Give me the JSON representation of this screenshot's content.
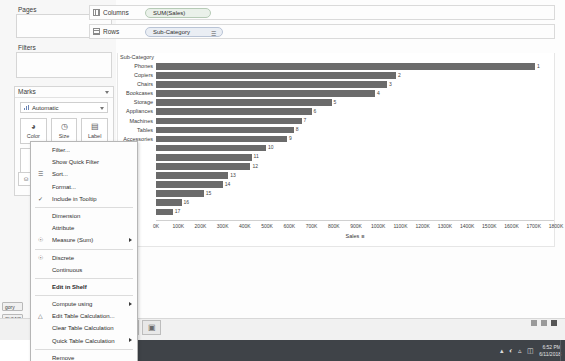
{
  "app": {
    "left_panel": {
      "pages_label": "Pages",
      "filters_label": "Filters",
      "marks_label": "Marks",
      "mark_type": "Automatic",
      "mark_buttons": [
        {
          "label": "Color",
          "icon": "palette-icon",
          "glyph": "◕"
        },
        {
          "label": "Size",
          "icon": "size-icon",
          "glyph": "◷"
        },
        {
          "label": "Label",
          "icon": "label-icon",
          "glyph": "▤"
        }
      ],
      "mark_buttons_row2": [
        {
          "label": "Detail",
          "icon": "detail-icon",
          "glyph": "⁙"
        },
        {
          "label": "Tooltip",
          "icon": "tooltip-icon",
          "glyph": "□"
        }
      ],
      "mini_pill_glyph": "⛁",
      "bottom_pills": [
        {
          "name": "sub-category-pill",
          "text": "gory"
        },
        {
          "name": "sum-sales-pill",
          "text": "SUM(S"
        }
      ],
      "bottom_icon_glyph": "◔"
    },
    "shelves": [
      {
        "icon": "columns-icon",
        "label": "Columns",
        "pill": {
          "text": "SUM(Sales)",
          "color": "green",
          "sort_icon": ""
        }
      },
      {
        "icon": "rows-icon",
        "label": "Rows",
        "pill": {
          "text": "Sub-Category",
          "color": "blue",
          "sort_icon": "☰"
        }
      }
    ],
    "context_menu": {
      "items": [
        {
          "label": "Filter...",
          "lead": "",
          "submenu": false,
          "bold": false,
          "sep_after": false
        },
        {
          "label": "Show Quick Filter",
          "lead": "",
          "submenu": false,
          "bold": false,
          "sep_after": false
        },
        {
          "label": "Sort...",
          "lead": "sort-icon",
          "submenu": false,
          "bold": false,
          "sep_after": false
        },
        {
          "label": "Format...",
          "lead": "",
          "submenu": false,
          "bold": false,
          "sep_after": false
        },
        {
          "label": "Include in Tooltip",
          "lead": "check-icon",
          "submenu": false,
          "bold": false,
          "sep_after": true
        },
        {
          "label": "Dimension",
          "lead": "",
          "submenu": false,
          "bold": false,
          "sep_after": false
        },
        {
          "label": "Attribute",
          "lead": "",
          "submenu": false,
          "bold": false,
          "sep_after": false
        },
        {
          "label": "Measure (Sum)",
          "lead": "radio-icon",
          "submenu": true,
          "bold": false,
          "sep_after": true
        },
        {
          "label": "Discrete",
          "lead": "radio-icon",
          "submenu": false,
          "bold": false,
          "sep_after": false
        },
        {
          "label": "Continuous",
          "lead": "",
          "submenu": false,
          "bold": false,
          "sep_after": true
        },
        {
          "label": "Edit in Shelf",
          "lead": "",
          "submenu": false,
          "bold": true,
          "sep_after": true
        },
        {
          "label": "Compute using",
          "lead": "",
          "submenu": true,
          "bold": false,
          "sep_after": false
        },
        {
          "label": "Edit Table Calculation...",
          "lead": "delta-icon",
          "submenu": false,
          "bold": false,
          "sep_after": false
        },
        {
          "label": "Clear Table Calculation",
          "lead": "",
          "submenu": false,
          "bold": false,
          "sep_after": false
        },
        {
          "label": "Quick Table Calculation",
          "lead": "",
          "submenu": true,
          "bold": false,
          "sep_after": true
        },
        {
          "label": "Remove",
          "lead": "",
          "submenu": false,
          "bold": false,
          "sep_after": false
        }
      ]
    },
    "bottom": {
      "sheet_tabs": [
        {
          "name": "new-worksheet-tab",
          "glyph": "⊞"
        },
        {
          "name": "new-dashboard-tab",
          "glyph": "▣"
        }
      ],
      "status_text": ""
    },
    "taskbar": {
      "time": "6:52 PM",
      "date": "6/11/2018",
      "tray_icons": [
        "chevron-up-icon",
        "network-icon",
        "sound-icon",
        "battery-icon"
      ]
    }
  },
  "chart_data": {
    "type": "bar",
    "title": "",
    "xlabel": "Sales",
    "ylabel": "Sub-Category",
    "grid": false,
    "legend": false,
    "xlim": [
      0,
      1800000
    ],
    "xticks": [
      "0K",
      "100K",
      "200K",
      "300K",
      "400K",
      "500K",
      "600K",
      "700K",
      "800K",
      "900K",
      "1000K",
      "1100K",
      "1200K",
      "1300K",
      "1400K",
      "1500K",
      "1600K",
      "1700K",
      "1800K"
    ],
    "bar_color": "#6b6b6b",
    "categories": [
      "Phones",
      "Copiers",
      "Chairs",
      "Bookcases",
      "Storage",
      "Appliances",
      "Machines",
      "Tables",
      "Accessories",
      "Binders",
      "Furnishings",
      "Paper",
      "Supplies",
      "Art",
      "Envelopes",
      "Labels",
      "Fasteners"
    ],
    "values": [
      1706000,
      1080000,
      1040000,
      985000,
      790000,
      700000,
      655000,
      620000,
      590000,
      495000,
      430000,
      425000,
      325000,
      300000,
      215000,
      115000,
      75000
    ],
    "labels": [
      "1",
      "2",
      "3",
      "4",
      "5",
      "6",
      "7",
      "8",
      "9",
      "10",
      "11",
      "12",
      "13",
      "14",
      "15",
      "16",
      "17"
    ],
    "visible_category_labels": [
      "Sub-Category",
      "Phones",
      "Copiers",
      "Chairs",
      "Bookcases",
      "Storage",
      "Appliances",
      "Machines",
      "Tables",
      "Accessories"
    ]
  }
}
